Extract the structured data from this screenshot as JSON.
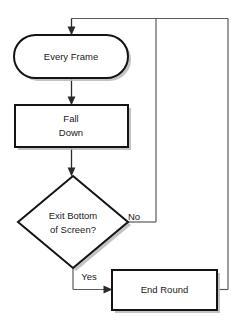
{
  "diagram": {
    "type": "flowchart",
    "canvas": {
      "width": 241,
      "height": 329,
      "background": "#ffffff"
    },
    "colors": {
      "stroke": "#141414",
      "connector": "#2b2b2b",
      "shadow": "#b9b9b9",
      "fill": "#ffffff",
      "text": "#1a1a1a"
    },
    "nodes": [
      {
        "id": "every-frame",
        "shape": "stadium",
        "label": "Every Frame",
        "lines": [
          "Every Frame"
        ],
        "x": 14,
        "y": 35,
        "width": 114,
        "height": 43
      },
      {
        "id": "fall-down",
        "shape": "rectangle",
        "label": "Fall Down",
        "lines": [
          "Fall",
          "Down"
        ],
        "x": 15,
        "y": 105,
        "width": 113,
        "height": 42
      },
      {
        "id": "exit-bottom-of-screen",
        "shape": "diamond",
        "label": "Exit Bottom of Screen?",
        "lines": [
          "Exit Bottom",
          "of Screen?"
        ],
        "cx": 73,
        "cy": 222,
        "rx": 55,
        "ry": 46
      },
      {
        "id": "end-round",
        "shape": "rectangle",
        "label": "End Round",
        "lines": [
          "End Round"
        ],
        "x": 112,
        "y": 270,
        "width": 105,
        "height": 40
      }
    ],
    "edges": [
      {
        "id": "edge-every-frame-to-fall-down",
        "from": "every-frame",
        "to": "fall-down",
        "label": ""
      },
      {
        "id": "edge-fall-down-to-decision",
        "from": "fall-down",
        "to": "exit-bottom-of-screen",
        "label": ""
      },
      {
        "id": "edge-decision-no-loop",
        "from": "exit-bottom-of-screen",
        "to": "every-frame",
        "label": "No"
      },
      {
        "id": "edge-decision-yes-to-end-round",
        "from": "exit-bottom-of-screen",
        "to": "end-round",
        "label": "Yes"
      },
      {
        "id": "edge-end-round-loop",
        "from": "end-round",
        "to": "every-frame",
        "label": ""
      }
    ],
    "labels": {
      "no": "No",
      "yes": "Yes"
    }
  }
}
